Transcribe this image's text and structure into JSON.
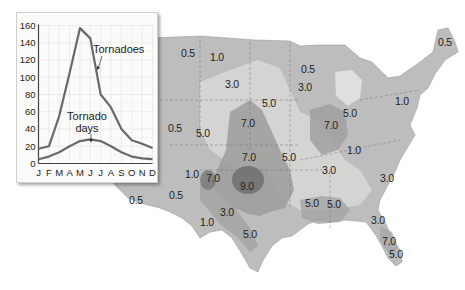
{
  "chart_data": {
    "type": "line",
    "title": "",
    "xlabel": "",
    "ylabel": "",
    "categories": [
      "J",
      "F",
      "M",
      "A",
      "M",
      "J",
      "J",
      "A",
      "S",
      "O",
      "N",
      "D"
    ],
    "y_ticks": [
      "0",
      "20",
      "40",
      "60",
      "80",
      "100",
      "120",
      "140",
      "160"
    ],
    "ylim": [
      0,
      160
    ],
    "grid": true,
    "series": [
      {
        "name": "Tornadoes",
        "values": [
          17,
          20,
          55,
          105,
          157,
          145,
          80,
          65,
          40,
          27,
          23,
          18
        ]
      },
      {
        "name": "Tornado days",
        "values": [
          5,
          8,
          13,
          20,
          26,
          28,
          26,
          20,
          13,
          8,
          6,
          5
        ]
      }
    ],
    "annotations": [
      {
        "text": "Tornadoes",
        "points_to": "Tornadoes"
      },
      {
        "text": "Tornado\ndays",
        "points_to": "Tornado days"
      }
    ]
  },
  "labels": {
    "tornadoes": "Tornadoes",
    "tornado_days_1": "Tornado",
    "tornado_days_2": "days"
  },
  "map": {
    "description": "Contour map of the contiguous United States showing average annual tornado frequency",
    "contour_labels": [
      {
        "text": "0.5",
        "x": 188,
        "y": 53
      },
      {
        "text": "1.0",
        "x": 217,
        "y": 57
      },
      {
        "text": "3.0",
        "x": 232,
        "y": 84
      },
      {
        "text": "0.5",
        "x": 308,
        "y": 69
      },
      {
        "text": "3.0",
        "x": 305,
        "y": 87
      },
      {
        "text": "0.5",
        "x": 445,
        "y": 42
      },
      {
        "text": "5.0",
        "x": 269,
        "y": 103
      },
      {
        "text": "1.0",
        "x": 402,
        "y": 101
      },
      {
        "text": "5.0",
        "x": 350,
        "y": 113
      },
      {
        "text": "7.0",
        "x": 248,
        "y": 123
      },
      {
        "text": "7.0",
        "x": 331,
        "y": 125
      },
      {
        "text": "0.5",
        "x": 175,
        "y": 128
      },
      {
        "text": "5.0",
        "x": 203,
        "y": 133
      },
      {
        "text": "7.0",
        "x": 249,
        "y": 157
      },
      {
        "text": "5.0",
        "x": 289,
        "y": 157
      },
      {
        "text": "1.0",
        "x": 354,
        "y": 150
      },
      {
        "text": "1.0",
        "x": 192,
        "y": 174
      },
      {
        "text": "7.0",
        "x": 213,
        "y": 178
      },
      {
        "text": "9.0",
        "x": 247,
        "y": 186
      },
      {
        "text": "3.0",
        "x": 329,
        "y": 170
      },
      {
        "text": "3.0",
        "x": 387,
        "y": 178
      },
      {
        "text": "0.5",
        "x": 136,
        "y": 200
      },
      {
        "text": "0.5",
        "x": 176,
        "y": 195
      },
      {
        "text": "5.0",
        "x": 312,
        "y": 203
      },
      {
        "text": "5.0",
        "x": 334,
        "y": 204
      },
      {
        "text": "3.0",
        "x": 227,
        "y": 212
      },
      {
        "text": "1.0",
        "x": 207,
        "y": 222
      },
      {
        "text": "3.0",
        "x": 378,
        "y": 220
      },
      {
        "text": "5.0",
        "x": 250,
        "y": 234
      },
      {
        "text": "7.0",
        "x": 389,
        "y": 241
      },
      {
        "text": "5.0",
        "x": 396,
        "y": 254
      }
    ]
  }
}
